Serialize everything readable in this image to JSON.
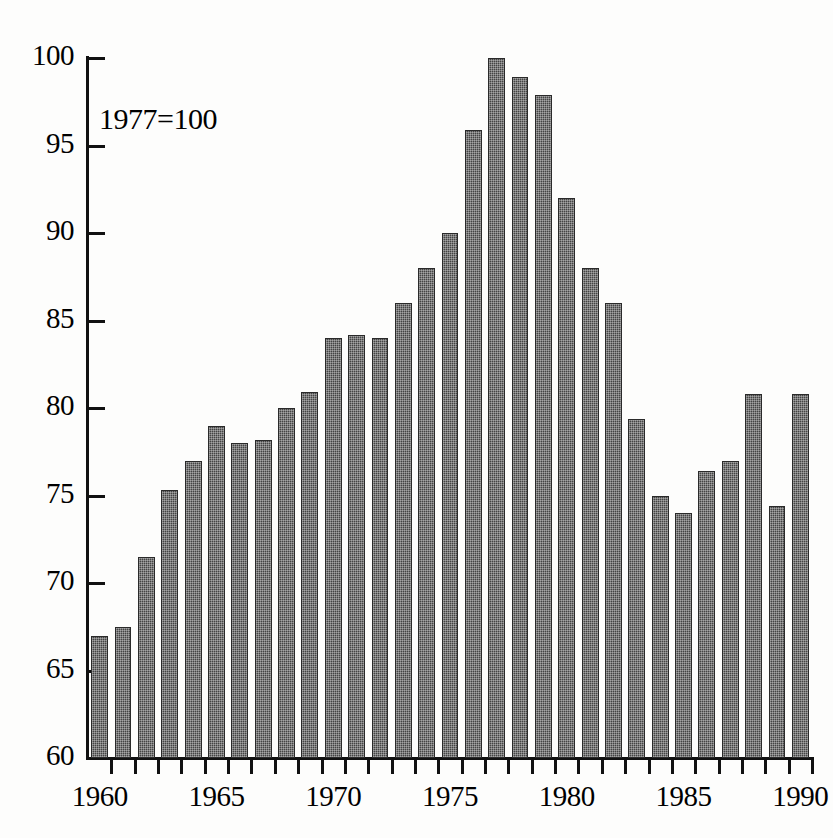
{
  "chart_data": {
    "type": "bar",
    "title": "",
    "subtitle": "",
    "annotation": "1977=100",
    "xlabel": "",
    "ylabel": "",
    "ylim": [
      60,
      100
    ],
    "xlim": [
      1959.5,
      1990.5
    ],
    "y_ticks": [
      60,
      65,
      70,
      75,
      80,
      85,
      90,
      95,
      100
    ],
    "y_tick_labels": [
      "60",
      "65",
      "70",
      "75",
      "80",
      "85",
      "90",
      "95",
      "100"
    ],
    "x_tick_labels": [
      "1960",
      "1965",
      "1970",
      "1975",
      "1980",
      "1985",
      "1990"
    ],
    "x_tick_values": [
      1960,
      1965,
      1970,
      1975,
      1980,
      1985,
      1990
    ],
    "grid": false,
    "legend": null,
    "bar_color": "#444444",
    "axis_color": "#111111",
    "background_color": "#fdfdfc",
    "categories": [
      "1960",
      "1961",
      "1962",
      "1963",
      "1964",
      "1965",
      "1966",
      "1967",
      "1968",
      "1969",
      "1970",
      "1971",
      "1972",
      "1973",
      "1974",
      "1975",
      "1976",
      "1977",
      "1978",
      "1979",
      "1980",
      "1981",
      "1982",
      "1983",
      "1984",
      "1985",
      "1986",
      "1987",
      "1988",
      "1989",
      "1990"
    ],
    "values": [
      67.0,
      67.5,
      71.5,
      75.3,
      77.0,
      79.0,
      78.0,
      78.2,
      80.0,
      80.9,
      84.0,
      84.2,
      84.0,
      86.0,
      88.0,
      90.0,
      95.9,
      100.0,
      98.9,
      97.9,
      92.0,
      88.0,
      86.0,
      79.4,
      75.0,
      74.0,
      76.4,
      77.0,
      80.8,
      74.4,
      80.8
    ]
  }
}
